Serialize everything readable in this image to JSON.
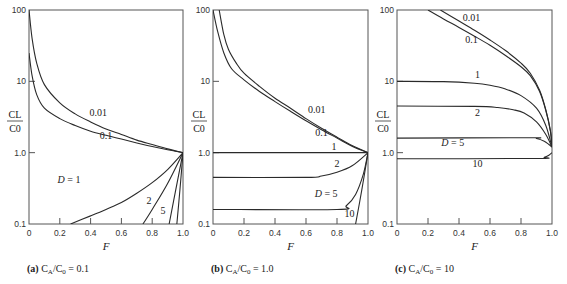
{
  "chart_data": [
    {
      "type": "line",
      "panel": "a",
      "caption_prefix": "(a)",
      "caption_text": "C_A/C_0 = 0.1",
      "caption_display": "CA/C0 = 0.1",
      "xlabel": "F",
      "ylabel_num": "CL",
      "ylabel_den": "C0",
      "xlim": [
        0,
        1.0
      ],
      "ylim": [
        0.1,
        100
      ],
      "yscale": "log",
      "xticks": [
        "0",
        "0.2",
        "0.4",
        "0.6",
        "0.8",
        "1.0"
      ],
      "yticks": [
        "0.1",
        "1.0",
        "10",
        "100"
      ],
      "series": [
        {
          "name": "D = 0.01",
          "label": "0.01",
          "points": [
            [
              0.0,
              100
            ],
            [
              0.02,
              40
            ],
            [
              0.05,
              18
            ],
            [
              0.1,
              9
            ],
            [
              0.2,
              5
            ],
            [
              0.3,
              3.5
            ],
            [
              0.4,
              2.7
            ],
            [
              0.5,
              2.15
            ],
            [
              0.6,
              1.8
            ],
            [
              0.7,
              1.5
            ],
            [
              0.8,
              1.3
            ],
            [
              0.9,
              1.13
            ],
            [
              1.0,
              1.0
            ]
          ]
        },
        {
          "name": "D = 0.1",
          "label": "0.1",
          "points": [
            [
              0.0,
              25
            ],
            [
              0.02,
              12
            ],
            [
              0.05,
              6.5
            ],
            [
              0.1,
              4.2
            ],
            [
              0.2,
              3.0
            ],
            [
              0.3,
              2.4
            ],
            [
              0.4,
              2.0
            ],
            [
              0.5,
              1.75
            ],
            [
              0.6,
              1.55
            ],
            [
              0.7,
              1.37
            ],
            [
              0.8,
              1.22
            ],
            [
              0.9,
              1.1
            ],
            [
              1.0,
              1.0
            ]
          ]
        },
        {
          "name": "D = 1",
          "label": "D = 1",
          "points": [
            [
              0.27,
              0.1
            ],
            [
              0.4,
              0.13
            ],
            [
              0.5,
              0.16
            ],
            [
              0.6,
              0.2
            ],
            [
              0.7,
              0.27
            ],
            [
              0.8,
              0.38
            ],
            [
              0.9,
              0.58
            ],
            [
              1.0,
              1.0
            ]
          ]
        },
        {
          "name": "D = 2",
          "label": "2",
          "points": [
            [
              0.74,
              0.1
            ],
            [
              0.8,
              0.16
            ],
            [
              0.9,
              0.37
            ],
            [
              1.0,
              1.0
            ]
          ]
        },
        {
          "name": "D = 5",
          "label": "5",
          "points": [
            [
              0.91,
              0.1
            ],
            [
              0.95,
              0.28
            ],
            [
              1.0,
              1.0
            ]
          ]
        },
        {
          "name": "D = 10",
          "label": "",
          "points": [
            [
              0.96,
              0.1
            ],
            [
              0.98,
              0.3
            ],
            [
              1.0,
              1.0
            ]
          ]
        }
      ],
      "annotations": [
        {
          "text": "0.01",
          "x": 0.45,
          "y": 3.3
        },
        {
          "text": "0.1",
          "x": 0.5,
          "y": 1.55
        },
        {
          "text": "D = 1",
          "x": 0.26,
          "y": 0.38
        },
        {
          "text": "2",
          "x": 0.78,
          "y": 0.19
        },
        {
          "text": "5",
          "x": 0.87,
          "y": 0.14
        }
      ]
    },
    {
      "type": "line",
      "panel": "b",
      "caption_prefix": "(b)",
      "caption_text": "C_A/C_0 = 1.0",
      "caption_display": "CA/C0 = 1.0",
      "xlabel": "F",
      "ylabel_num": "CL",
      "ylabel_den": "C0",
      "xlim": [
        0,
        1.0
      ],
      "ylim": [
        0.1,
        100
      ],
      "yscale": "log",
      "xticks": [
        "0",
        "0.2",
        "0.4",
        "0.6",
        "0.8",
        "1.0"
      ],
      "yticks": [
        "0.1",
        "1.0",
        "10",
        "100"
      ],
      "series": [
        {
          "name": "D = 0.01",
          "label": "0.01",
          "points": [
            [
              0.04,
              100
            ],
            [
              0.07,
              45
            ],
            [
              0.1,
              28
            ],
            [
              0.15,
              18
            ],
            [
              0.2,
              13
            ],
            [
              0.3,
              8.5
            ],
            [
              0.4,
              5.8
            ],
            [
              0.5,
              4.2
            ],
            [
              0.6,
              3.0
            ],
            [
              0.7,
              2.2
            ],
            [
              0.8,
              1.65
            ],
            [
              0.9,
              1.25
            ],
            [
              1.0,
              1.0
            ]
          ]
        },
        {
          "name": "D = 0.1",
          "label": "0.1",
          "points": [
            [
              0.0,
              100
            ],
            [
              0.03,
              50
            ],
            [
              0.07,
              25
            ],
            [
              0.12,
              15
            ],
            [
              0.2,
              10.5
            ],
            [
              0.3,
              7.2
            ],
            [
              0.4,
              5.2
            ],
            [
              0.5,
              3.8
            ],
            [
              0.6,
              2.8
            ],
            [
              0.7,
              2.1
            ],
            [
              0.8,
              1.6
            ],
            [
              0.9,
              1.22
            ],
            [
              1.0,
              1.0
            ]
          ]
        },
        {
          "name": "D = 1",
          "label": "1",
          "points": [
            [
              0.0,
              1.0
            ],
            [
              1.0,
              1.0
            ]
          ]
        },
        {
          "name": "D = 2",
          "label": "2",
          "points": [
            [
              0.0,
              0.45
            ],
            [
              0.6,
              0.45
            ],
            [
              0.7,
              0.47
            ],
            [
              0.8,
              0.53
            ],
            [
              0.9,
              0.66
            ],
            [
              1.0,
              1.0
            ]
          ]
        },
        {
          "name": "D = 5",
          "label": "D = 5",
          "points": [
            [
              0.0,
              0.16
            ],
            [
              0.8,
              0.16
            ],
            [
              0.86,
              0.18
            ],
            [
              0.92,
              0.26
            ],
            [
              0.97,
              0.5
            ],
            [
              1.0,
              1.0
            ]
          ]
        },
        {
          "name": "D = 10",
          "label": "10",
          "points": [
            [
              0.92,
              0.1
            ],
            [
              0.96,
              0.3
            ],
            [
              1.0,
              1.0
            ]
          ]
        }
      ],
      "annotations": [
        {
          "text": "0.01",
          "x": 0.67,
          "y": 3.6
        },
        {
          "text": "0.1",
          "x": 0.7,
          "y": 1.7
        },
        {
          "text": "1",
          "x": 0.78,
          "y": 1.1
        },
        {
          "text": "2",
          "x": 0.8,
          "y": 0.62
        },
        {
          "text": "D = 5",
          "x": 0.73,
          "y": 0.24
        },
        {
          "text": "10",
          "x": 0.88,
          "y": 0.125
        }
      ]
    },
    {
      "type": "line",
      "panel": "c",
      "caption_prefix": "(c)",
      "caption_text": "C_A/C_0 = 10",
      "caption_display": "CA/C0 = 10",
      "xlabel": "F",
      "ylabel_num": "CL",
      "ylabel_den": "C0",
      "xlim": [
        0,
        1.0
      ],
      "ylim": [
        0.1,
        100
      ],
      "yscale": "log",
      "xticks": [
        "0",
        "0.2",
        "0.4",
        "0.6",
        "0.8",
        "1.0"
      ],
      "yticks": [
        "0.1",
        "1.0",
        "10",
        "100"
      ],
      "series": [
        {
          "name": "D = 0.01",
          "label": "0.01",
          "points": [
            [
              0.28,
              100
            ],
            [
              0.4,
              70
            ],
            [
              0.5,
              52
            ],
            [
              0.6,
              38
            ],
            [
              0.7,
              27
            ],
            [
              0.8,
              18
            ],
            [
              0.86,
              13
            ],
            [
              0.92,
              7.5
            ],
            [
              0.96,
              4.0
            ],
            [
              0.99,
              2.0
            ],
            [
              1.0,
              1.2
            ]
          ]
        },
        {
          "name": "D = 0.1",
          "label": "0.1",
          "points": [
            [
              0.2,
              100
            ],
            [
              0.3,
              75
            ],
            [
              0.4,
              57
            ],
            [
              0.5,
              43
            ],
            [
              0.6,
              32
            ],
            [
              0.7,
              23
            ],
            [
              0.8,
              16
            ],
            [
              0.86,
              12
            ],
            [
              0.92,
              7.2
            ],
            [
              0.96,
              3.9
            ],
            [
              0.99,
              2.0
            ],
            [
              1.0,
              1.2
            ]
          ]
        },
        {
          "name": "D = 1",
          "label": "1",
          "points": [
            [
              0.0,
              10
            ],
            [
              0.3,
              9.9
            ],
            [
              0.5,
              9.4
            ],
            [
              0.6,
              8.8
            ],
            [
              0.7,
              7.8
            ],
            [
              0.8,
              6.3
            ],
            [
              0.9,
              4.2
            ],
            [
              0.96,
              2.4
            ],
            [
              1.0,
              1.2
            ]
          ]
        },
        {
          "name": "D = 2",
          "label": "2",
          "points": [
            [
              0.0,
              4.5
            ],
            [
              0.5,
              4.45
            ],
            [
              0.65,
              4.3
            ],
            [
              0.75,
              4.0
            ],
            [
              0.82,
              3.6
            ],
            [
              0.9,
              2.7
            ],
            [
              0.96,
              1.8
            ],
            [
              1.0,
              1.2
            ]
          ]
        },
        {
          "name": "D = 5",
          "label": "D = 5",
          "points": [
            [
              0.0,
              1.6
            ],
            [
              0.85,
              1.62
            ],
            [
              0.9,
              1.58
            ],
            [
              0.95,
              1.45
            ],
            [
              0.98,
              1.3
            ],
            [
              1.0,
              1.2
            ]
          ]
        },
        {
          "name": "D = 10",
          "label": "10",
          "points": [
            [
              0.0,
              0.82
            ],
            [
              0.9,
              0.83
            ],
            [
              0.95,
              0.86
            ],
            [
              0.98,
              0.92
            ],
            [
              1.0,
              1.0
            ]
          ]
        }
      ],
      "annotations": [
        {
          "text": "0.01",
          "x": 0.48,
          "y": 70
        },
        {
          "text": "0.1",
          "x": 0.48,
          "y": 35
        },
        {
          "text": "1",
          "x": 0.52,
          "y": 11
        },
        {
          "text": "2",
          "x": 0.52,
          "y": 3.3
        },
        {
          "text": "D = 5",
          "x": 0.36,
          "y": 1.25
        },
        {
          "text": "10",
          "x": 0.52,
          "y": 0.62
        }
      ]
    }
  ]
}
